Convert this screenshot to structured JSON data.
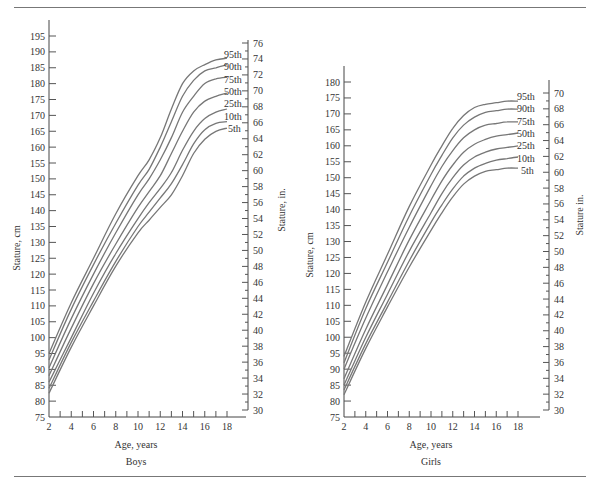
{
  "chart_data": [
    {
      "type": "line",
      "title": "Boys",
      "xlabel": "Age, years",
      "ylabel": "Stature, cm",
      "ylabel_right": "Stature, in.",
      "x": [
        2,
        4,
        6,
        8,
        10,
        11,
        12,
        13,
        14,
        15,
        16,
        17,
        18
      ],
      "x_ticks": [
        2,
        4,
        6,
        8,
        10,
        12,
        14,
        16,
        18
      ],
      "xlim": [
        2,
        20
      ],
      "ylim": [
        75,
        195
      ],
      "y_ticks": [
        75,
        80,
        85,
        90,
        95,
        100,
        105,
        110,
        115,
        120,
        125,
        130,
        135,
        140,
        145,
        150,
        155,
        160,
        165,
        170,
        175,
        180,
        185,
        190,
        195
      ],
      "y_right_ticks": [
        30,
        32,
        34,
        36,
        38,
        40,
        42,
        44,
        46,
        48,
        50,
        52,
        54,
        56,
        58,
        60,
        62,
        64,
        66,
        68,
        70,
        72,
        74,
        76
      ],
      "y_right_range_in": [
        30,
        76
      ],
      "grid": false,
      "legend_position": "right-end labels",
      "series": [
        {
          "name": "95th",
          "values": [
            95,
            111,
            125,
            139,
            151,
            156,
            163,
            172,
            180,
            184,
            186,
            187.5,
            188
          ]
        },
        {
          "name": "90th",
          "values": [
            93,
            109,
            123,
            136,
            148,
            153,
            160,
            168,
            176,
            181,
            184,
            185,
            186
          ]
        },
        {
          "name": "75th",
          "values": [
            90.5,
            106,
            120,
            133,
            145,
            150,
            156,
            163,
            171,
            176,
            180,
            181.5,
            182
          ]
        },
        {
          "name": "50th",
          "values": [
            88,
            103,
            117,
            129.5,
            141,
            146,
            151,
            158,
            165,
            171,
            174.5,
            176,
            177
          ]
        },
        {
          "name": "25th",
          "values": [
            86,
            100,
            114,
            126.5,
            137.5,
            142.5,
            147,
            152,
            159,
            165,
            169,
            171,
            172
          ]
        },
        {
          "name": "10th",
          "values": [
            84,
            98.5,
            111.5,
            124,
            135,
            139.5,
            144,
            148.5,
            154.5,
            161,
            165.5,
            167.5,
            168
          ]
        },
        {
          "name": "5th",
          "values": [
            82.5,
            97,
            110,
            122.5,
            133,
            137,
            141,
            145,
            151,
            158,
            162.5,
            165,
            166
          ]
        }
      ]
    },
    {
      "type": "line",
      "title": "Girls",
      "xlabel": "Age, years",
      "ylabel": "Stature, cm",
      "ylabel_right": "Stature in.",
      "x": [
        2,
        4,
        6,
        8,
        10,
        11,
        12,
        13,
        14,
        15,
        16,
        17,
        18
      ],
      "x_ticks": [
        2,
        4,
        6,
        8,
        10,
        12,
        14,
        16,
        18
      ],
      "xlim": [
        2,
        20
      ],
      "ylim": [
        75,
        180
      ],
      "y_ticks": [
        75,
        80,
        85,
        90,
        95,
        100,
        105,
        110,
        115,
        120,
        125,
        130,
        135,
        140,
        145,
        150,
        155,
        160,
        165,
        170,
        175,
        180
      ],
      "y_right_ticks": [
        30,
        32,
        34,
        36,
        38,
        40,
        42,
        44,
        46,
        48,
        50,
        52,
        54,
        56,
        58,
        60,
        62,
        64,
        66,
        68,
        70
      ],
      "y_right_range_in": [
        30,
        70
      ],
      "grid": false,
      "legend_position": "right-end labels",
      "series": [
        {
          "name": "95th",
          "values": [
            94,
            111,
            126,
            141,
            154,
            160,
            165.5,
            169.5,
            172,
            173,
            173.5,
            174,
            174
          ]
        },
        {
          "name": "90th",
          "values": [
            92,
            109,
            123.5,
            138,
            151,
            157,
            162.5,
            166.5,
            169,
            170.5,
            171,
            171.5,
            171.5
          ]
        },
        {
          "name": "75th",
          "values": [
            90,
            106,
            120.5,
            134.5,
            147.5,
            153.5,
            158.5,
            162.5,
            165,
            166.5,
            167,
            167.5,
            167.5
          ]
        },
        {
          "name": "50th",
          "values": [
            87,
            102.5,
            116.5,
            130.5,
            143,
            149,
            154,
            158,
            160.5,
            162,
            163,
            163.5,
            164
          ]
        },
        {
          "name": "25th",
          "values": [
            85,
            100,
            113.5,
            127,
            139,
            145,
            150,
            154,
            156.5,
            158,
            159,
            159.5,
            160
          ]
        },
        {
          "name": "10th",
          "values": [
            83.5,
            98,
            111,
            124,
            136,
            141.5,
            146.5,
            150.5,
            153,
            154.5,
            155.5,
            156,
            156.5
          ]
        },
        {
          "name": "5th",
          "values": [
            82,
            96.5,
            109.5,
            122,
            133.5,
            139,
            144,
            148,
            150.5,
            152,
            152.5,
            153,
            153
          ]
        }
      ]
    }
  ],
  "labels": {
    "boys": {
      "panel_title": "Boys",
      "xlabel": "Age, years",
      "ylabel_left": "Stature, cm",
      "ylabel_right": "Stature, in."
    },
    "girls": {
      "panel_title": "Girls",
      "xlabel": "Age, years",
      "ylabel_left": "Stature, cm",
      "ylabel_right": "Stature in."
    }
  }
}
